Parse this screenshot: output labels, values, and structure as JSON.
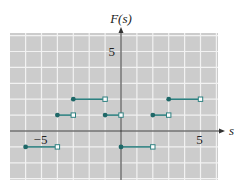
{
  "chart_data": {
    "type": "line",
    "title": "",
    "xlabel": "s",
    "ylabel": "F(s)",
    "xlim": [
      -7,
      6
    ],
    "ylim": [
      -3,
      6
    ],
    "grid": true,
    "x_tick_labels": [
      {
        "value": -5,
        "label": "−5"
      },
      {
        "value": 5,
        "label": "5"
      }
    ],
    "y_tick_labels": [
      {
        "value": 5,
        "label": "5"
      }
    ],
    "series": [
      {
        "name": "F(s) step function",
        "style": "step segments: closed dot at left end, open square at right end",
        "segments": [
          {
            "x_start": -6,
            "x_end": -4,
            "y": -1
          },
          {
            "x_start": -4,
            "x_end": -3,
            "y": 1
          },
          {
            "x_start": -3,
            "x_end": -1,
            "y": 2
          },
          {
            "x_start": -1,
            "x_end": 0,
            "y": 1
          },
          {
            "x_start": 0,
            "x_end": 2,
            "y": -1
          },
          {
            "x_start": 2,
            "x_end": 3,
            "y": 1
          },
          {
            "x_start": 3,
            "x_end": 5,
            "y": 2
          }
        ]
      }
    ],
    "colors": {
      "line": "#2e8080",
      "closed_dot": "#1f6868",
      "open_marker_fill": "#ffffff",
      "grid_background": "#cccccc",
      "grid_lines": "#f2f2f2",
      "axis": "#333333"
    }
  }
}
